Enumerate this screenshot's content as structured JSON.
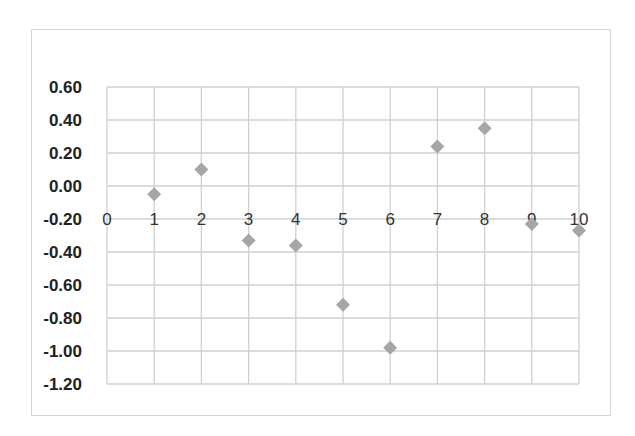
{
  "chart_data": {
    "type": "scatter",
    "title": "",
    "xlabel": "",
    "ylabel": "",
    "x": [
      1,
      2,
      3,
      4,
      5,
      6,
      7,
      8,
      9,
      10
    ],
    "series": [
      {
        "name": "Series1",
        "x": [
          1,
          2,
          3,
          4,
          5,
          6,
          7,
          8,
          9,
          10
        ],
        "y": [
          -0.05,
          0.1,
          -0.33,
          -0.36,
          -0.72,
          -0.98,
          0.24,
          0.35,
          -0.23,
          -0.27
        ],
        "marker": "diamond",
        "color": "#a6a6a6"
      }
    ],
    "xlim": [
      0,
      10
    ],
    "ylim": [
      -1.2,
      0.6
    ],
    "x_ticks": [
      "0",
      "1",
      "2",
      "3",
      "4",
      "5",
      "6",
      "7",
      "8",
      "9",
      "10"
    ],
    "y_ticks": [
      "0.60",
      "0.40",
      "0.20",
      "0.00",
      "-0.20",
      "-0.40",
      "-0.60",
      "-0.80",
      "-1.00",
      "-1.20"
    ],
    "x_axis_crosses_at": -0.2,
    "grid": true,
    "legend": "none"
  },
  "colors": {
    "grid": "#d0d0d0",
    "marker": "#a6a6a6",
    "text": "#333333"
  }
}
